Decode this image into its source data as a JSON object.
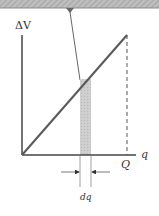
{
  "diagram": {
    "y_axis_label": "ΔV",
    "x_axis_label": "q",
    "x_max_label": "Q",
    "strip_width_label": "dq",
    "colors": {
      "line": "#5a5a5a",
      "axis": "#444444",
      "strip": "#c8c8c8",
      "banner": "#b5b5b5",
      "text": "#333333"
    }
  }
}
